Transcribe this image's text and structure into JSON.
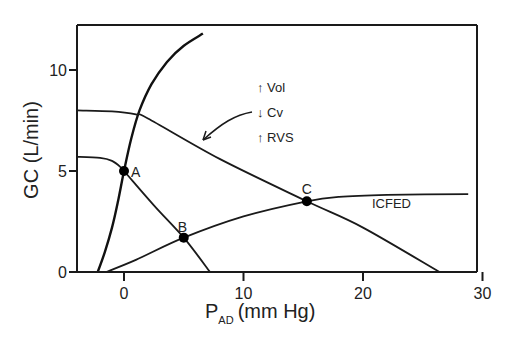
{
  "chart_data": {
    "type": "line",
    "title": "",
    "xlabel": "P",
    "xlabel_sub": "AD",
    "xlabel_unit": "(mm Hg)",
    "ylabel": "GC (L/min)",
    "xlim": [
      -3.9,
      30
    ],
    "ylim": [
      0,
      12.3
    ],
    "xticks": [
      0,
      10,
      20,
      30
    ],
    "yticks": [
      0,
      5,
      10
    ],
    "grid": false,
    "series": [
      {
        "name": "cardiac-function-normal",
        "style": "bold",
        "points": [
          [
            -2.2,
            0
          ],
          [
            -1.6,
            1
          ],
          [
            -1.0,
            2.2
          ],
          [
            -0.5,
            3.5
          ],
          [
            0,
            5
          ],
          [
            0.6,
            6.6
          ],
          [
            1.3,
            8
          ],
          [
            2.3,
            9.3
          ],
          [
            3.6,
            10.4
          ],
          [
            5,
            11.2
          ],
          [
            6.6,
            11.8
          ]
        ]
      },
      {
        "name": "venous-return-normal",
        "style": "normal",
        "points": [
          [
            -3.9,
            5.7
          ],
          [
            -2,
            5.65
          ],
          [
            -1,
            5.5
          ],
          [
            -0.3,
            5.2
          ],
          [
            0,
            5
          ],
          [
            2.5,
            3.3
          ],
          [
            5,
            1.7
          ],
          [
            7.2,
            0
          ]
        ]
      },
      {
        "name": "venous-return-shifted",
        "style": "normal",
        "points": [
          [
            -3.9,
            8.0
          ],
          [
            -1,
            7.95
          ],
          [
            1,
            7.8
          ],
          [
            2,
            7.6
          ],
          [
            8,
            5.6
          ],
          [
            15.3,
            3.5
          ],
          [
            20,
            2.2
          ],
          [
            26.4,
            0
          ]
        ]
      },
      {
        "name": "ICFED",
        "style": "normal",
        "points": [
          [
            -1.5,
            0
          ],
          [
            1,
            0.6
          ],
          [
            5,
            1.7
          ],
          [
            10,
            2.75
          ],
          [
            15.3,
            3.5
          ],
          [
            18,
            3.72
          ],
          [
            22,
            3.82
          ],
          [
            28.8,
            3.85
          ]
        ]
      }
    ],
    "points": [
      {
        "label": "A",
        "x": 0,
        "y": 5
      },
      {
        "label": "B",
        "x": 5,
        "y": 1.7
      },
      {
        "label": "C",
        "x": 15.3,
        "y": 3.5
      }
    ],
    "annotations": {
      "curve_label": "ICFED",
      "changes": [
        "↑ Vol",
        "↓ Cv",
        "↑ RVS"
      ]
    }
  }
}
